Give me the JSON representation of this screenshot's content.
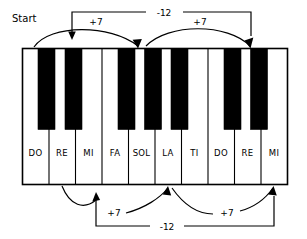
{
  "figure": {
    "start_label": "Start",
    "keyboard": {
      "white_keys": [
        {
          "label": "DO"
        },
        {
          "label": "RE"
        },
        {
          "label": "MI"
        },
        {
          "label": "FA"
        },
        {
          "label": "SOL"
        },
        {
          "label": "LA"
        },
        {
          "label": "TI"
        },
        {
          "label": "DO"
        },
        {
          "label": "RE"
        },
        {
          "label": "MI"
        }
      ],
      "black_key_count": 7,
      "black_key_gaps": [
        0,
        1,
        3,
        4,
        5,
        7,
        8
      ]
    },
    "annotations": {
      "top": [
        {
          "name": "top-interval-1",
          "label": "+7"
        },
        {
          "name": "top-interval-2",
          "label": "-12"
        },
        {
          "name": "top-interval-3",
          "label": "+7"
        }
      ],
      "bottom": [
        {
          "name": "bottom-interval-1",
          "label": "+7"
        },
        {
          "name": "bottom-interval-2",
          "label": "+7"
        },
        {
          "name": "bottom-interval-3",
          "label": "-12"
        }
      ]
    },
    "colors": {
      "ink": "#000000",
      "paper": "#ffffff"
    }
  }
}
